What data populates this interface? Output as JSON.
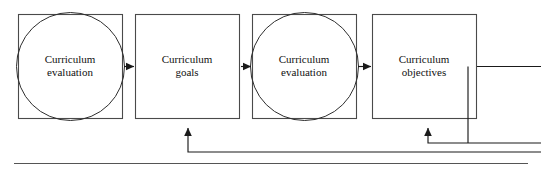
{
  "diagram": {
    "type": "flow-diagram",
    "title": "",
    "orientation": "left-to-right",
    "stroke_color": "#444444",
    "background_color": "#ffffff",
    "nodes": [
      {
        "id": "n1",
        "label": "Curriculum\nevaluation",
        "shape": "square-with-inscribed-circle",
        "x": 18,
        "y": 14,
        "w": 104,
        "h": 104
      },
      {
        "id": "n2",
        "label": "Curriculum\ngoals",
        "shape": "square",
        "x": 135,
        "y": 14,
        "w": 104,
        "h": 104
      },
      {
        "id": "n3",
        "label": "Curriculum\nevaluation",
        "shape": "square-with-inscribed-circle",
        "x": 252,
        "y": 14,
        "w": 104,
        "h": 104
      },
      {
        "id": "n4",
        "label": "Curriculum\nobjectives",
        "shape": "square",
        "x": 372,
        "y": 14,
        "w": 104,
        "h": 104
      }
    ],
    "connectors": [
      {
        "id": "c1",
        "from": "n1",
        "to": "n2",
        "kind": "arrow",
        "direction": "right"
      },
      {
        "id": "c2",
        "from": "n2",
        "to": "n3",
        "kind": "arrow",
        "direction": "right"
      },
      {
        "id": "c3",
        "from": "n3",
        "to": "n4",
        "kind": "arrow",
        "direction": "right"
      },
      {
        "id": "c4",
        "from": "n4",
        "to": "n4-bottom",
        "kind": "feedback-arrow",
        "direction": "up"
      },
      {
        "id": "c5",
        "from": "feedback-bus",
        "to": "n2",
        "kind": "feedback-arrow",
        "direction": "up"
      },
      {
        "id": "c6",
        "from": "n4",
        "to": "right-edge",
        "kind": "line",
        "direction": "right"
      }
    ],
    "rules": [
      {
        "id": "r1",
        "kind": "horizontal-rule",
        "x1": 14,
        "y1": 163,
        "x2": 528,
        "y2": 163
      }
    ]
  }
}
